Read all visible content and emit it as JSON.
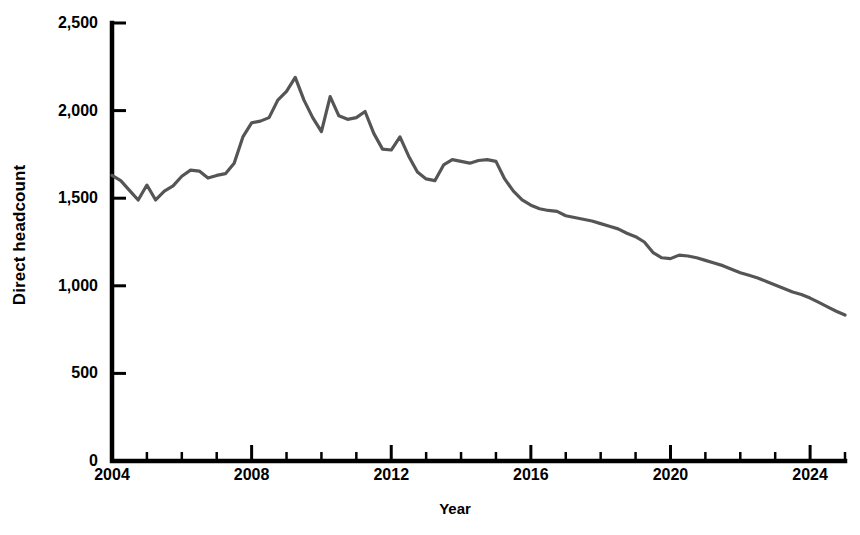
{
  "chart_data": {
    "type": "line",
    "title": "",
    "xlabel": "Year",
    "ylabel": "Direct headcount",
    "xlim": [
      2004,
      2025.0
    ],
    "ylim": [
      0,
      2500
    ],
    "grid": false,
    "legend": "none",
    "line_color": "#555555",
    "axis_color": "#000000",
    "y_ticks": [
      0,
      500,
      1000,
      1500,
      2000,
      2500
    ],
    "y_tick_labels": [
      "0",
      "500",
      "1,000",
      "1,500",
      "2,000",
      "2,500"
    ],
    "x_major_ticks": [
      2004,
      2008,
      2012,
      2016,
      2020,
      2024
    ],
    "x_major_tick_labels": [
      "2004",
      "2008",
      "2012",
      "2016",
      "2020",
      "2024"
    ],
    "x_minor_tick_interval": 1,
    "x_minor_ticks": [
      2005,
      2006,
      2007,
      2009,
      2010,
      2011,
      2013,
      2014,
      2015,
      2017,
      2018,
      2019,
      2021,
      2022,
      2023,
      2025
    ],
    "series_name": "Direct headcount",
    "x": [
      2004.0,
      2004.25,
      2004.5,
      2004.75,
      2005.0,
      2005.25,
      2005.5,
      2005.75,
      2006.0,
      2006.25,
      2006.5,
      2006.75,
      2007.0,
      2007.25,
      2007.5,
      2007.75,
      2008.0,
      2008.25,
      2008.5,
      2008.75,
      2009.0,
      2009.25,
      2009.5,
      2009.75,
      2010.0,
      2010.25,
      2010.5,
      2010.75,
      2011.0,
      2011.25,
      2011.5,
      2011.75,
      2012.0,
      2012.25,
      2012.5,
      2012.75,
      2013.0,
      2013.25,
      2013.5,
      2013.75,
      2014.0,
      2014.25,
      2014.5,
      2014.75,
      2015.0,
      2015.25,
      2015.5,
      2015.75,
      2016.0,
      2016.25,
      2016.5,
      2016.75,
      2017.0,
      2017.25,
      2017.5,
      2017.75,
      2018.0,
      2018.25,
      2018.5,
      2018.75,
      2019.0,
      2019.25,
      2019.5,
      2019.75,
      2020.0,
      2020.25,
      2020.5,
      2020.75,
      2021.0,
      2021.25,
      2021.5,
      2021.75,
      2022.0,
      2022.25,
      2022.5,
      2022.75,
      2023.0,
      2023.25,
      2023.5,
      2023.75,
      2024.0,
      2024.25,
      2024.5,
      2024.75,
      2025.0
    ],
    "values": [
      1630,
      1600,
      1545,
      1490,
      1575,
      1490,
      1540,
      1570,
      1625,
      1660,
      1655,
      1615,
      1630,
      1640,
      1700,
      1850,
      1930,
      1940,
      1960,
      2060,
      2110,
      2190,
      2060,
      1960,
      1880,
      2080,
      1970,
      1950,
      1960,
      1995,
      1870,
      1780,
      1775,
      1850,
      1740,
      1650,
      1610,
      1600,
      1690,
      1720,
      1710,
      1700,
      1715,
      1720,
      1710,
      1610,
      1540,
      1490,
      1460,
      1440,
      1430,
      1425,
      1400,
      1390,
      1380,
      1370,
      1355,
      1340,
      1325,
      1300,
      1280,
      1250,
      1190,
      1160,
      1155,
      1175,
      1170,
      1160,
      1145,
      1130,
      1115,
      1095,
      1075,
      1060,
      1045,
      1025,
      1005,
      985,
      965,
      950,
      930,
      905,
      880,
      855,
      833
    ]
  }
}
